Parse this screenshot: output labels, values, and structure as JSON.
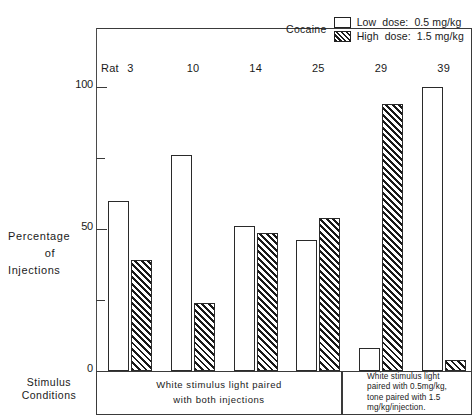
{
  "chart_data": {
    "type": "bar",
    "title": "",
    "drug_label": "Cocaine",
    "xlabel": "Stimulus Conditions",
    "ylabel": "Percentage of Injections",
    "ylabel_lines": [
      "Percentage",
      "of",
      "Injections"
    ],
    "xlabel_lines": [
      "Stimulus",
      "Conditions"
    ],
    "ylim": [
      0,
      105
    ],
    "y_ticks_major": [
      0,
      50,
      100
    ],
    "y_ticks_minor": [
      25,
      75
    ],
    "y_tick_labels": [
      "0",
      "50",
      "100"
    ],
    "grid": false,
    "legend_position": "top-right",
    "categories": [
      "3",
      "10",
      "14",
      "25",
      "29",
      "39"
    ],
    "category_prefix": "Rat",
    "series": [
      {
        "name": "Low dose: 0.5 mg/kg",
        "short_name": "Low",
        "dose_label": "dose:",
        "dose_value": "0.5 mg/kg",
        "fill": "open",
        "values": [
          60,
          76,
          51,
          46,
          8,
          100
        ]
      },
      {
        "name": "High dose: 1.5 mg/kg",
        "short_name": "High",
        "dose_label": "dose:",
        "dose_value": "1.5  mg/kg",
        "fill": "hatched",
        "values": [
          39,
          24,
          48.5,
          54,
          94,
          4
        ]
      }
    ],
    "annotations": [
      {
        "id": "cond-left",
        "text": "White stimulus light paired with both injections",
        "lines": [
          "White stimulus light paired",
          "with both injections"
        ],
        "covers_categories": [
          "3",
          "10",
          "14",
          "25"
        ]
      },
      {
        "id": "cond-right",
        "text": "White stimulus light paired with 0.5mg/kg, tone paired with 1.5 mg/kg/injection.",
        "lines": [
          "White stimulus light",
          "paired with 0.5mg/kg,",
          "tone paired with 1.5",
          "mg/kg/injection."
        ],
        "covers_categories": [
          "29",
          "39"
        ]
      }
    ]
  },
  "colors": {
    "ink": "#1a1a1a",
    "axis": "#3a3a3a",
    "bar_outline": "#2a2a2a",
    "hatch": "#191919",
    "background": "#ffffff"
  }
}
